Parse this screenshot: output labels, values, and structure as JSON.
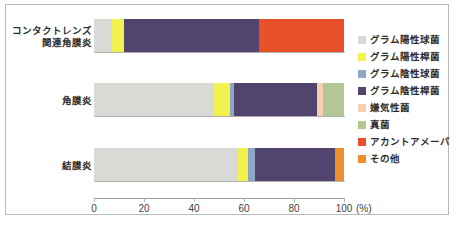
{
  "chart_data": {
    "type": "bar",
    "orientation": "horizontal",
    "stacked": true,
    "normalized": true,
    "title": "",
    "xlabel": "(%)",
    "ylabel": "",
    "xlim": [
      0,
      100
    ],
    "xticks": [
      0,
      20,
      40,
      60,
      80,
      100
    ],
    "xtick_labels": [
      "0",
      "20",
      "40",
      "60",
      "80",
      "100"
    ],
    "unit_label": "(%)",
    "grid": false,
    "legend_position": "right",
    "categories": [
      "コンタクトレンズ\n関連角膜炎",
      "角膜炎",
      "結膜炎"
    ],
    "category_labels": [
      {
        "line1": "コンタクトレンズ",
        "line2": "関連角膜炎"
      },
      {
        "line1": "角膜炎",
        "line2": ""
      },
      {
        "line1": "結膜炎",
        "line2": ""
      }
    ],
    "series": [
      {
        "name": "グラム陽性球菌",
        "color": "#d9d9d6",
        "values": [
          7.0,
          48.0,
          57.5
        ]
      },
      {
        "name": "グラム陽性桿菌",
        "color": "#f2f24f",
        "values": [
          5.0,
          6.5,
          4.0
        ]
      },
      {
        "name": "グラム陰性球菌",
        "color": "#8fa7c4",
        "values": [
          0.0,
          1.5,
          3.0
        ]
      },
      {
        "name": "グラム陰性桿菌",
        "color": "#514570",
        "values": [
          54.0,
          33.0,
          32.0
        ]
      },
      {
        "name": "嫌気性菌",
        "color": "#f7cfae",
        "values": [
          0.0,
          2.5,
          0.0
        ]
      },
      {
        "name": "真菌",
        "color": "#b3c795",
        "values": [
          0.0,
          8.5,
          0.0
        ]
      },
      {
        "name": "アカントアメーバ",
        "color": "#e8502a",
        "values": [
          34.0,
          0.0,
          0.0
        ]
      },
      {
        "name": "その他",
        "color": "#ed8f2e",
        "values": [
          0.0,
          0.0,
          3.5
        ]
      }
    ]
  },
  "caption": ""
}
